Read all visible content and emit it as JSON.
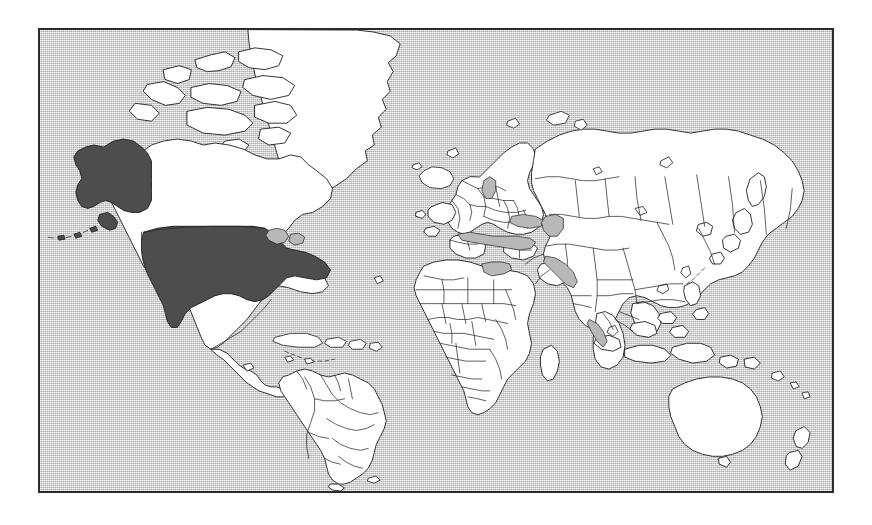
{
  "figure": {
    "type": "world-map",
    "projection": "mercator",
    "canvas": {
      "width": 872,
      "height": 525
    },
    "frame": {
      "left": 38,
      "top": 28,
      "width": 796,
      "height": 465,
      "border_color": "#2b2b2b",
      "border_width": 2
    }
  },
  "legend": {
    "ocean_label": "Ocean / background",
    "land_label": "Land (unhighlighted)",
    "highlight_label": "United States of America"
  },
  "colors": {
    "ocean": "#cccccc",
    "land_fill": "#ffffff",
    "land_stroke": "#1c1c1c",
    "border_stroke": "#2a2a2a",
    "highlight_fill": "#4d4d4d",
    "frame": "#2b2b2b",
    "page_background": "#ffffff"
  },
  "highlighted_regions": [
    {
      "name": "United States (contiguous)",
      "code": "US-48",
      "fill": "#4d4d4d"
    },
    {
      "name": "Alaska",
      "code": "US-AK",
      "fill": "#4d4d4d"
    }
  ],
  "landmasses": [
    {
      "name": "North America",
      "fill": "#ffffff"
    },
    {
      "name": "Greenland",
      "fill": "#ffffff"
    },
    {
      "name": "South America",
      "fill": "#ffffff"
    },
    {
      "name": "Europe",
      "fill": "#ffffff"
    },
    {
      "name": "Africa",
      "fill": "#ffffff"
    },
    {
      "name": "Asia",
      "fill": "#ffffff"
    },
    {
      "name": "Australia",
      "fill": "#ffffff"
    },
    {
      "name": "New Zealand",
      "fill": "#ffffff"
    },
    {
      "name": "Madagascar",
      "fill": "#ffffff"
    },
    {
      "name": "Iceland",
      "fill": "#ffffff"
    },
    {
      "name": "Japan",
      "fill": "#ffffff"
    },
    {
      "name": "Indonesia",
      "fill": "#ffffff"
    },
    {
      "name": "Philippines",
      "fill": "#ffffff"
    },
    {
      "name": "Caribbean islands",
      "fill": "#ffffff"
    },
    {
      "name": "Canadian Arctic Archipelago",
      "fill": "#ffffff"
    }
  ]
}
